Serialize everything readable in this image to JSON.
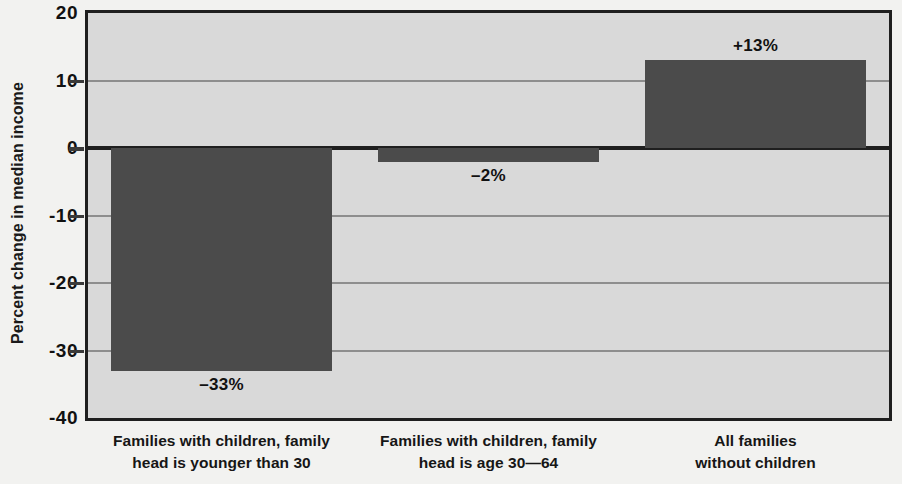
{
  "chart_data": {
    "type": "bar",
    "title": "",
    "subtitle": "",
    "xlabel": "",
    "ylabel": "Percent change in median income",
    "ylim": [
      -40,
      20
    ],
    "grid": true,
    "legend": null,
    "y_ticks": [
      {
        "value": 20,
        "label": "20"
      },
      {
        "value": 10,
        "label": "10"
      },
      {
        "value": 0,
        "label": "0"
      },
      {
        "value": -10,
        "label": "-10"
      },
      {
        "value": -20,
        "label": "-20"
      },
      {
        "value": -30,
        "label": "-30"
      },
      {
        "value": -40,
        "label": "-40"
      }
    ],
    "categories": [
      "Families with children, family head is younger than 30",
      "Families with children, family head is age 30—64",
      "All families without children"
    ],
    "category_lines": [
      [
        "Families with children, family",
        "head is younger than 30"
      ],
      [
        "Families with children, family",
        "head is age 30—64"
      ],
      [
        "All families",
        "without children"
      ]
    ],
    "values": [
      -33,
      -2,
      13
    ],
    "value_labels": [
      "–33%",
      "–2%",
      "+13%"
    ],
    "colors": {
      "bar": "#4b4b4b",
      "plot_background": "#d9d9d9",
      "page_background": "#f2f2f0",
      "axis": "#1f1f1f",
      "gridline": "#8e8e8e",
      "text": "#111111"
    }
  }
}
